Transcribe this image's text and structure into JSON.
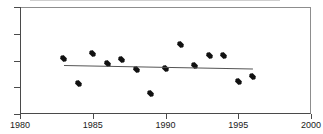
{
  "chart_data": {
    "type": "scatter",
    "title": "",
    "subtitle": "",
    "xlabel": "",
    "ylabel": "",
    "xlim": [
      1980,
      2000
    ],
    "ylim": [
      4,
      8
    ],
    "grid": false,
    "legend": null,
    "x_ticks": [
      1980,
      1985,
      1990,
      1995,
      2000
    ],
    "x_tick_labels": [
      "1980",
      "1985",
      "1990",
      "1995",
      "2000"
    ],
    "y_ticks": [
      4,
      5,
      6,
      7,
      8
    ],
    "y_tick_labels": [
      "4",
      "5",
      "6",
      "7",
      "8"
    ],
    "marker": "filled-diamond",
    "marker_color": "#111111",
    "series": [
      {
        "name": "observations",
        "x": [
          1983,
          1984,
          1985,
          1986,
          1987,
          1988,
          1989,
          1990,
          1991,
          1992,
          1993,
          1994,
          1995,
          1996
        ],
        "values": [
          6.08,
          5.13,
          6.27,
          5.9,
          6.03,
          5.66,
          4.75,
          5.69,
          6.59,
          5.81,
          6.18,
          6.18,
          5.2,
          5.4
        ]
      }
    ],
    "trend_line": {
      "name": "linear-fit",
      "color": "#555555",
      "x_start": 1983,
      "x_end": 1996,
      "y_start": 5.85,
      "y_end": 5.72
    }
  }
}
